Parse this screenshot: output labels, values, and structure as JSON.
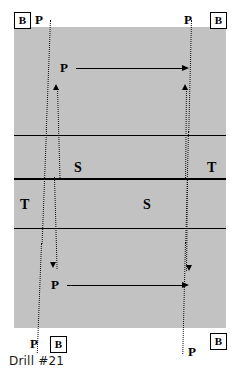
{
  "diagram": {
    "caption": "Drill #21",
    "field": {
      "fill_color": "#c2c2c2",
      "line_color": "#000000",
      "x": 14,
      "y": 27,
      "width": 212,
      "height": 301
    },
    "zone_lines": [
      {
        "name": "upper-thin-line",
        "y": 135,
        "weight": "thin"
      },
      {
        "name": "center-thick-line",
        "y": 178,
        "weight": "thick"
      },
      {
        "name": "lower-thin-line",
        "y": 228,
        "weight": "thin"
      }
    ],
    "zone_labels": [
      {
        "text": "S",
        "x": 74,
        "y": 161
      },
      {
        "text": "T",
        "x": 207,
        "y": 161
      },
      {
        "text": "T",
        "x": 20,
        "y": 198
      },
      {
        "text": "S",
        "x": 143,
        "y": 198
      }
    ],
    "player_labels": [
      {
        "name": "player-label-top-left",
        "text": "P",
        "x": 35,
        "y": 13
      },
      {
        "name": "player-label-top-right",
        "text": "P",
        "x": 184,
        "y": 13
      },
      {
        "name": "player-label-upper-pass",
        "text": "P",
        "x": 60,
        "y": 61
      },
      {
        "name": "player-label-lower-pass",
        "text": "P",
        "x": 51,
        "y": 278
      },
      {
        "name": "player-label-bottom-left",
        "text": "P",
        "x": 30,
        "y": 337
      },
      {
        "name": "player-label-bottom-right",
        "text": "P",
        "x": 188,
        "y": 345
      }
    ],
    "base_markers": [
      {
        "name": "base-marker-top-left",
        "text": "B",
        "x": 14,
        "y": 12
      },
      {
        "name": "base-marker-top-right",
        "text": "B",
        "x": 210,
        "y": 12
      },
      {
        "name": "base-marker-bottom-left",
        "text": "B",
        "x": 50,
        "y": 336
      },
      {
        "name": "base-marker-bottom-right",
        "text": "B",
        "x": 210,
        "y": 333
      }
    ],
    "pass_arrows": [
      {
        "name": "pass-arrow-upper",
        "x": 76,
        "y": 68,
        "length": 108,
        "direction": "right"
      },
      {
        "name": "pass-arrow-lower",
        "x": 67,
        "y": 285,
        "length": 117,
        "direction": "right"
      }
    ],
    "run_paths": [
      {
        "name": "run-path-left-outer",
        "x": 45,
        "y_start": 20,
        "y_end": 352,
        "arrow": "none"
      },
      {
        "name": "run-path-left-inner",
        "x": 53,
        "y_start": 80,
        "y_end": 268,
        "arrow": "both"
      },
      {
        "name": "run-path-right-outer",
        "x": 189,
        "y_start": 20,
        "y_end": 352,
        "arrow": "none"
      },
      {
        "name": "run-path-right-inner",
        "x": 182,
        "y_start": 80,
        "y_end": 268,
        "arrow": "both"
      }
    ]
  }
}
